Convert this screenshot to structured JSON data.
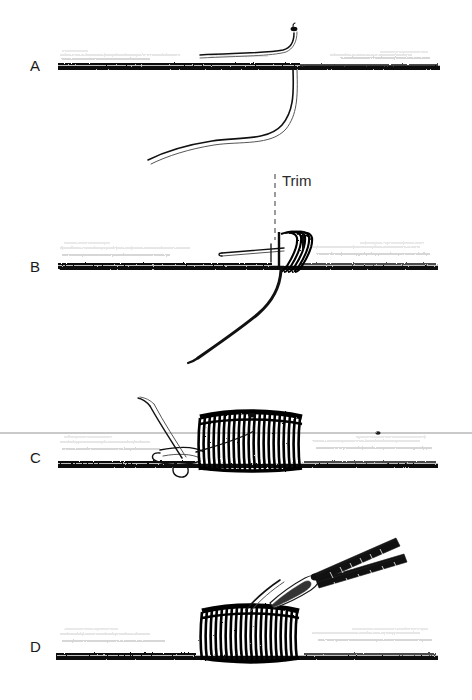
{
  "figure": {
    "medium": "scanned line illustration",
    "background_color": "#ffffff",
    "ink_color": "#000000",
    "width": 472,
    "height": 700
  },
  "panels": [
    {
      "id": "A",
      "label": "A",
      "label_x": 30,
      "label_y": 71,
      "caption": "",
      "description": "Rod blank shown in side view with thread laid over it; the tag end of the thread rises at the right and curves down below the blank in a long S-shape."
    },
    {
      "id": "B",
      "label": "B",
      "label_x": 30,
      "label_y": 272,
      "caption": "",
      "description": "A few turns of thread wrapped over the blank; a loop of thread lies under the wraps pointing left, and the running end drops below the blank."
    },
    {
      "id": "C",
      "label": "C",
      "label_x": 30,
      "label_y": 463,
      "caption": "",
      "description": "Dense barrel of thread wraps built up on the blank with a pull loop protruding to the left and the tag end angled up and to the left."
    },
    {
      "id": "D",
      "label": "D",
      "label_x": 30,
      "label_y": 652,
      "caption": "",
      "description": "Completed wrap with scissors trimming the protruding tag end flush at the top of the wrap."
    }
  ],
  "annotations": [
    {
      "id": "trim",
      "text": "Trim",
      "x": 282,
      "y": 186,
      "leader": {
        "type": "dashed-vertical",
        "x": 275,
        "y_start": 172,
        "y_end": 240
      }
    }
  ],
  "artifacts": [
    {
      "id": "scan-line",
      "type": "horizontal-grey-line",
      "y": 433,
      "x_start": 0,
      "x_end": 472,
      "color": "#b7b7b7"
    }
  ],
  "colors": {
    "ink": "#000000",
    "paper": "#ffffff",
    "rod_top_line": "#3b3b3b",
    "rod_shade": "#8e8e8e",
    "annotation": "#2b2b2b",
    "artifact": "#b7b7b7"
  }
}
